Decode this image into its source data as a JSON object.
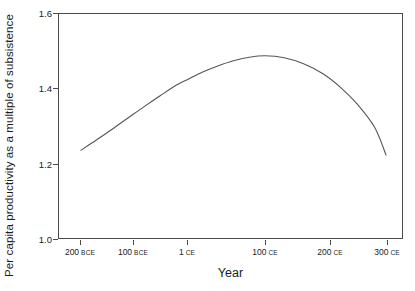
{
  "chart_data": {
    "type": "line",
    "title": "",
    "xlabel": "Year",
    "ylabel": "Per capita productivity as a multiple of subsistence",
    "ylim": [
      1.0,
      1.6
    ],
    "ytick_values": [
      "1.6",
      "1.4",
      "1.2",
      "1.0"
    ],
    "ytick_numeric": [
      1.6,
      1.4,
      1.2,
      1.0
    ],
    "xtick_labels": [
      "200 BCE",
      "100 BCE",
      "1 CE",
      "100 CE",
      "200 CE",
      "300 CE"
    ],
    "xtick_numbers": [
      "200",
      "100",
      "1",
      "100",
      "200",
      "300"
    ],
    "xtick_eras": [
      "BCE",
      "BCE",
      "CE",
      "CE",
      "CE",
      "CE"
    ],
    "xtick_years": [
      -200,
      -100,
      1,
      100,
      200,
      300
    ],
    "grid": false,
    "legend": false,
    "series": [
      {
        "name": "Per capita productivity",
        "x": [
          -200,
          -170,
          -140,
          -110,
          -80,
          -50,
          -20,
          1,
          20,
          40,
          60,
          80,
          100,
          130,
          160,
          190,
          220,
          250,
          280,
          300
        ],
        "values": [
          1.235,
          1.263,
          1.292,
          1.322,
          1.352,
          1.381,
          1.409,
          1.424,
          1.444,
          1.461,
          1.475,
          1.484,
          1.488,
          1.483,
          1.467,
          1.44,
          1.403,
          1.357,
          1.296,
          1.222
        ]
      }
    ],
    "line_color": "#555555",
    "frame_color": "#4a4a4a",
    "background": "#ffffff",
    "peak": {
      "x": 75,
      "y": 1.488
    }
  }
}
